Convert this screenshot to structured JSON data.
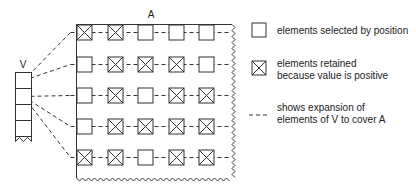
{
  "diagram": {
    "matrix_label": "A",
    "vector_label": "V",
    "grid": [
      [
        true,
        true,
        false,
        false,
        false
      ],
      [
        false,
        true,
        true,
        true,
        false
      ],
      [
        false,
        true,
        false,
        true,
        true
      ],
      [
        false,
        true,
        true,
        true,
        true
      ],
      [
        true,
        true,
        false,
        true,
        true
      ]
    ],
    "vector_cells": 4,
    "expansion_links": [
      {
        "from_vector_cell": 0,
        "to_row": 0
      },
      {
        "from_vector_cell": 0,
        "to_row": 1
      },
      {
        "from_vector_cell": 1,
        "to_row": 2
      },
      {
        "from_vector_cell": 1,
        "to_row": 3
      },
      {
        "from_vector_cell": 1,
        "to_row": 4
      }
    ]
  },
  "legend": {
    "items": [
      {
        "icon": "empty-square",
        "lines": [
          "elements selected by position"
        ]
      },
      {
        "icon": "crossed-square",
        "lines": [
          "elements retained",
          "because value is positive"
        ]
      },
      {
        "icon": "dashed-line",
        "lines": [
          "shows expansion of",
          "elements of V to cover A"
        ]
      }
    ]
  },
  "colors": {
    "stroke": "#333333",
    "text": "#222222"
  }
}
